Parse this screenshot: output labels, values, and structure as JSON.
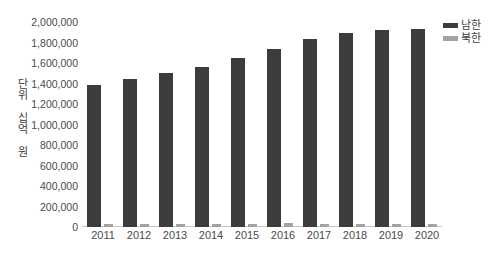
{
  "chart_data": {
    "type": "bar",
    "title": "",
    "xlabel": "",
    "ylabel": "단위 십억 원",
    "categories": [
      "2011",
      "2012",
      "2013",
      "2014",
      "2015",
      "2016",
      "2017",
      "2018",
      "2019",
      "2020"
    ],
    "series": [
      {
        "name": "남한",
        "color": "#3c3c3c",
        "values": [
          1390000,
          1440000,
          1500000,
          1560000,
          1650000,
          1740000,
          1830000,
          1890000,
          1920000,
          1930000
        ]
      },
      {
        "name": "북한",
        "color": "#a3a3a3",
        "values": [
          32000,
          32000,
          33000,
          34000,
          34000,
          35000,
          34000,
          33000,
          33000,
          32000
        ]
      }
    ],
    "ylim": [
      0,
      2000000
    ],
    "ytick_values": [
      0,
      200000,
      400000,
      600000,
      800000,
      1000000,
      1200000,
      1400000,
      1600000,
      1800000,
      2000000
    ],
    "ytick_labels": [
      "0",
      "200,000",
      "400,000",
      "600,000",
      "800,000",
      "1,000,000",
      "1,200,000",
      "1,400,000",
      "1,600,000",
      "1,800,000",
      "2,000,000"
    ],
    "grid": false,
    "legend_position": "top-right"
  },
  "legend": {
    "items": [
      {
        "label": "남한",
        "color": "#3c3c3c"
      },
      {
        "label": "북한",
        "color": "#a3a3a3"
      }
    ]
  }
}
